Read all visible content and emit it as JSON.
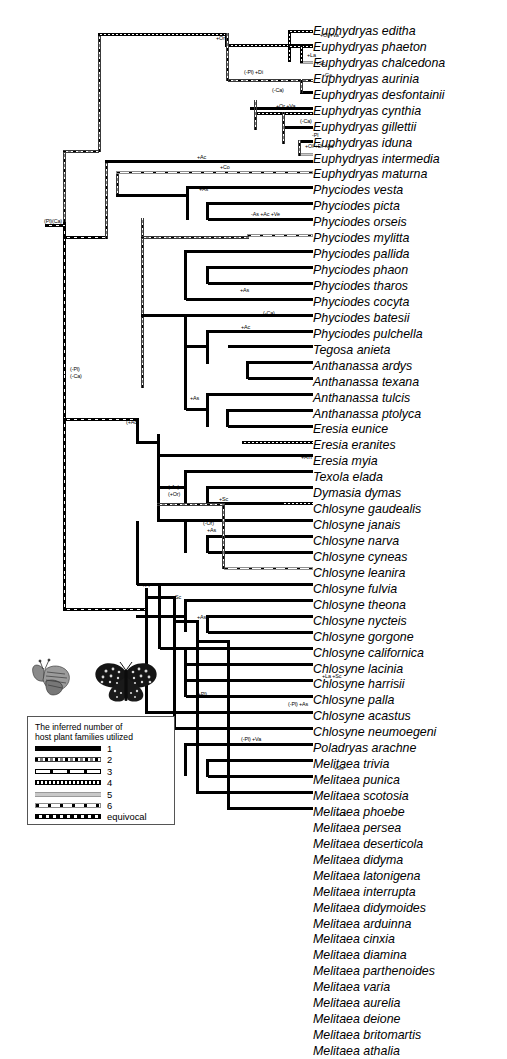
{
  "figure": {
    "type": "phylogenetic-tree"
  },
  "taxa": [
    "Euphydryas editha",
    "Euphydryas phaeton",
    "Euphydryas chalcedona",
    "Euphydryas aurinia",
    "Euphydryas desfontainii",
    "Euphydryas cynthia",
    "Euphydryas gillettii",
    "Euphydryas iduna",
    "Euphydryas intermedia",
    "Euphydryas maturna",
    "Phyciodes vesta",
    "Phyciodes picta",
    "Phyciodes orseis",
    "Phyciodes mylitta",
    "Phyciodes pallida",
    "Phyciodes phaon",
    "Phyciodes tharos",
    "Phyciodes cocyta",
    "Phyciodes batesii",
    "Phyciodes pulchella",
    "Tegosa anieta",
    "Anthanassa ardys",
    "Anthanassa texana",
    "Anthanassa tulcis",
    "Anthanassa ptolyca",
    "Eresia eunice",
    "Eresia eranites",
    "Eresia myia",
    "Texola elada",
    "Dymasia dymas",
    "Chlosyne gaudealis",
    "Chlosyne janais",
    "Chlosyne narva",
    "Chlosyne cyneas",
    "Chlosyne leanira",
    "Chlosyne fulvia",
    "Chlosyne theona",
    "Chlosyne nycteis",
    "Chlosyne gorgone",
    "Chlosyne californica",
    "Chlosyne lacinia",
    "Chlosyne harrisii",
    "Chlosyne palla",
    "Chlosyne acastus",
    "Chlosyne neumoegeni",
    "Poladryas arachne",
    "Melitaea trivia",
    "Melitaea punica",
    "Melitaea scotosia",
    "Melitaea phoebe",
    "Melitaea persea",
    "Melitaea deserticola",
    "Melitaea didyma",
    "Melitaea latonigena",
    "Melitaea interrupta",
    "Melitaea didymoides",
    "Melitaea arduinna",
    "Melitaea cinxia",
    "Melitaea diamina",
    "Melitaea parthenoides",
    "Melitaea varia",
    "Melitaea aurelia",
    "Melitaea deione",
    "Melitaea britomartis",
    "Melitaea athalia"
  ],
  "node_labels": [
    {
      "id": "root",
      "text": "(Pl)(Ca)",
      "x": 44,
      "y": 219
    },
    {
      "id": "n-minuspl",
      "text": "(-Pl)",
      "x": 70,
      "y": 367
    },
    {
      "id": "n-minusca",
      "text": "(-Ca)",
      "x": 70,
      "y": 374
    },
    {
      "id": "n-plus-or",
      "text": "+Or",
      "x": 216,
      "y": 36
    },
    {
      "id": "n-plus-ol-va",
      "text": "+Ol +Va",
      "x": 320,
      "y": 33
    },
    {
      "id": "n-plus-la",
      "text": "+La",
      "x": 307,
      "y": 53
    },
    {
      "id": "n-plus-sc-e",
      "text": "+Sc",
      "x": 316,
      "y": 61
    },
    {
      "id": "n-minuspl-di",
      "text": "(-Pl) +Di",
      "x": 244,
      "y": 70
    },
    {
      "id": "n-plus-ge-e",
      "text": "+Ge",
      "x": 322,
      "y": 73
    },
    {
      "id": "n-minusca-1",
      "text": "(-Ca)",
      "x": 272,
      "y": 88
    },
    {
      "id": "n-or-va",
      "text": "+Or +Va",
      "x": 276,
      "y": 104
    },
    {
      "id": "n-minusca-2",
      "text": "(-Ca)",
      "x": 300,
      "y": 119
    },
    {
      "id": "n-minus-pl",
      "text": "-Pl",
      "x": 312,
      "y": 133
    },
    {
      "id": "n-ol-di-ad",
      "text": "+Ol +Di +Ad",
      "x": 305,
      "y": 144
    },
    {
      "id": "n-plus-ac-1",
      "text": "+Ac",
      "x": 197,
      "y": 155
    },
    {
      "id": "n-plus-co",
      "text": "+Co",
      "x": 220,
      "y": 165
    },
    {
      "id": "n-plus-as-1",
      "text": "+As",
      "x": 199,
      "y": 187
    },
    {
      "id": "n-as-ac-ve",
      "text": "-As +Ac +Ve",
      "x": 251,
      "y": 212
    },
    {
      "id": "n-plus-as-2",
      "text": "+As",
      "x": 240,
      "y": 288
    },
    {
      "id": "n-minusca-3",
      "text": "(-Ca)",
      "x": 263,
      "y": 311
    },
    {
      "id": "n-plus-ac-2",
      "text": "+Ac",
      "x": 241,
      "y": 325
    },
    {
      "id": "n-plus-as-3",
      "text": "+As",
      "x": 190,
      "y": 396
    },
    {
      "id": "n-par-plus-ac",
      "text": "(+Ac)",
      "x": 126,
      "y": 420
    },
    {
      "id": "n-plus-am",
      "text": "+Am",
      "x": 301,
      "y": 455
    },
    {
      "id": "n-minus-ac",
      "text": "(-Ac)",
      "x": 168,
      "y": 485
    },
    {
      "id": "n-plus-or-2",
      "text": "(+Or)",
      "x": 168,
      "y": 492
    },
    {
      "id": "n-plus-sc-2",
      "text": "+Sc",
      "x": 219,
      "y": 497
    },
    {
      "id": "n-minus-or",
      "text": "(-Or)",
      "x": 203,
      "y": 521
    },
    {
      "id": "n-plus-as-4",
      "text": "+As",
      "x": 207,
      "y": 528
    },
    {
      "id": "n-plus-pl",
      "text": "+Pl",
      "x": 142,
      "y": 583
    },
    {
      "id": "n-plus-sc-3",
      "text": "+Sc",
      "x": 172,
      "y": 595
    },
    {
      "id": "n-plus-as-5",
      "text": "+As",
      "x": 197,
      "y": 615
    },
    {
      "id": "n-plus-la-2",
      "text": "+La +Sc",
      "x": 322,
      "y": 674
    },
    {
      "id": "n-par-plus-pl",
      "text": "(+Pl)",
      "x": 196,
      "y": 692
    },
    {
      "id": "n-minus-pl-as",
      "text": "(-Pl) +As",
      "x": 288,
      "y": 702
    },
    {
      "id": "n-minus-pl-va",
      "text": "(-Pl) +Va",
      "x": 241,
      "y": 737
    },
    {
      "id": "n-plus-ge-2",
      "text": "+Ge",
      "x": 334,
      "y": 766
    },
    {
      "id": "n-plus-or-3",
      "text": "+Or",
      "x": 337,
      "y": 812
    }
  ],
  "legend": {
    "title_line1": "The inferred number of",
    "title_line2": "host plant families utilized",
    "items": [
      {
        "pattern": "p1",
        "label": "1"
      },
      {
        "pattern": "p2",
        "label": "2"
      },
      {
        "pattern": "p3",
        "label": "3"
      },
      {
        "pattern": "p4",
        "label": "4"
      },
      {
        "pattern": "p5",
        "label": "5"
      },
      {
        "pattern": "p6",
        "label": "6"
      },
      {
        "pattern": "peq",
        "label": "equivocal"
      }
    ]
  },
  "images": [
    {
      "name": "butterfly-side-view"
    },
    {
      "name": "butterfly-dorsal-view"
    }
  ]
}
